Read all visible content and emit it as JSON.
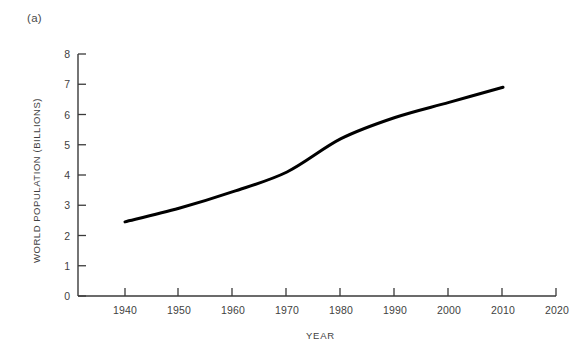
{
  "figure": {
    "panel_label": "(a)",
    "background_color": "#ffffff",
    "line_color": "#000000",
    "axis_color": "#3a3a3a"
  },
  "chart_data": {
    "type": "line",
    "title": "",
    "subtitle": "",
    "panel": "(a)",
    "xlabel": "YEAR",
    "ylabel": "WORLD POPULATION (BILLIONS)",
    "xlim": [
      1935,
      2028
    ],
    "ylim": [
      0,
      8
    ],
    "xticks": [
      1940,
      1950,
      1960,
      1970,
      1980,
      1990,
      2000,
      2010,
      2020
    ],
    "xtick_labels": [
      "1940",
      "1950",
      "1960",
      "1970",
      "1980",
      "1990",
      "2000",
      "2010",
      "2020"
    ],
    "yticks": [
      0,
      1,
      2,
      3,
      4,
      5,
      6,
      7,
      8
    ],
    "ytick_labels": [
      "0",
      "1",
      "2",
      "3",
      "4",
      "5",
      "6",
      "7",
      "8"
    ],
    "grid": false,
    "legend": null,
    "annotations": [],
    "series": [
      {
        "name": "World population",
        "color": "#000000",
        "line_width": 3,
        "x": [
          1940,
          1950,
          1960,
          1970,
          1980,
          1990,
          2000,
          2010
        ],
        "values": [
          2.45,
          2.9,
          3.45,
          4.1,
          5.2,
          5.9,
          6.4,
          6.9
        ]
      }
    ]
  }
}
